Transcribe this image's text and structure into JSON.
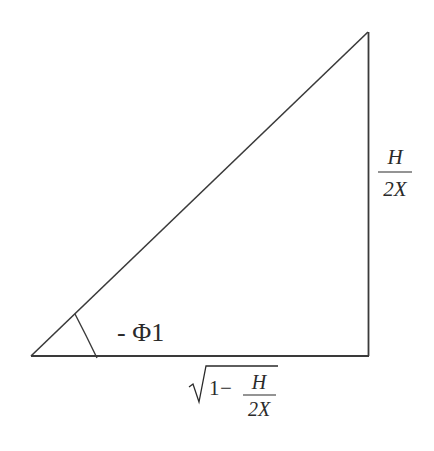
{
  "diagram": {
    "type": "right-triangle",
    "angle_label": {
      "prefix": "- ",
      "symbol": "Φ",
      "subscript": "1",
      "full": "- Φ1"
    },
    "vertical_side_label": {
      "numerator": "H",
      "denominator": "2X"
    },
    "horizontal_side_label": {
      "radical_leading": "1",
      "operator": "−",
      "numerator": "H",
      "denominator": "2X"
    },
    "stroke_color": "#3a3a3a",
    "text_color": "#2a2a2a"
  }
}
